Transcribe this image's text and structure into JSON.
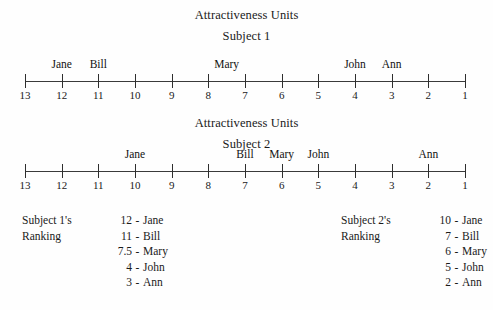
{
  "figure": {
    "background_color": "#fefefe",
    "ink_color": "#1a1a1a"
  },
  "panels": [
    {
      "title": "Attractiveness Units",
      "subtitle": "Subject 1",
      "scale_min": 1,
      "scale_max": 13
    },
    {
      "title": "Attractiveness Units",
      "subtitle": "Subject 2",
      "scale_min": 1,
      "scale_max": 13
    }
  ],
  "rankings": [
    {
      "caption_line1": "Subject 1's",
      "caption_line2": "Ranking",
      "dash": "-",
      "rows": [
        {
          "value": "12",
          "name": "Jane"
        },
        {
          "value": "11",
          "name": "Bill"
        },
        {
          "value": "7.5",
          "name": "Mary"
        },
        {
          "value": "4",
          "name": "John"
        },
        {
          "value": "3",
          "name": "Ann"
        }
      ]
    },
    {
      "caption_line1": "Subject 2's",
      "caption_line2": "Ranking",
      "dash": "-",
      "rows": [
        {
          "value": "10",
          "name": "Jane"
        },
        {
          "value": "7",
          "name": "Bill"
        },
        {
          "value": "6",
          "name": "Mary"
        },
        {
          "value": "5",
          "name": "John"
        },
        {
          "value": "2",
          "name": "Ann"
        }
      ]
    }
  ],
  "chart_data": {
    "type": "scatter",
    "title": "Attractiveness Units",
    "xlabel": "",
    "ylabel": "",
    "grid": false,
    "legend": "none",
    "x_axis": {
      "reversed": true,
      "ticks": [
        13,
        12,
        11,
        10,
        9,
        8,
        7,
        6,
        5,
        4,
        3,
        2,
        1
      ],
      "tick_labels": [
        "13",
        "12",
        "11",
        "10",
        "9",
        "8",
        "7",
        "6",
        "5",
        "4",
        "3",
        "2",
        "1"
      ],
      "xlim": [
        13,
        1
      ]
    },
    "series": [
      {
        "name": "Subject 1",
        "points": [
          {
            "label": "Jane",
            "x": 12
          },
          {
            "label": "Bill",
            "x": 11
          },
          {
            "label": "Mary",
            "x": 7.5
          },
          {
            "label": "John",
            "x": 4
          },
          {
            "label": "Ann",
            "x": 3
          }
        ]
      },
      {
        "name": "Subject 2",
        "points": [
          {
            "label": "Jane",
            "x": 10
          },
          {
            "label": "Bill",
            "x": 7
          },
          {
            "label": "Mary",
            "x": 6
          },
          {
            "label": "John",
            "x": 5
          },
          {
            "label": "Ann",
            "x": 2
          }
        ]
      }
    ]
  }
}
